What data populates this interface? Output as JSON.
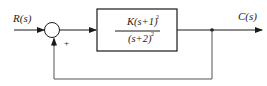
{
  "diagram": {
    "type": "closed-loop control block diagram",
    "input_label": "R(s)",
    "output_label": "C(s)",
    "summing_junction": {
      "sign_feedback": "+"
    },
    "forward_block": {
      "numerator": "K(s+1)",
      "numerator_exponent": "2",
      "denominator": "(s+2)",
      "denominator_exponent": "2",
      "transfer_function": "K(s+1)^2/(s+2)^2"
    },
    "feedback": "unity",
    "colors": {
      "line": "#1a1a1a",
      "feedback_line": "#555555",
      "background": "#ffffff"
    }
  }
}
